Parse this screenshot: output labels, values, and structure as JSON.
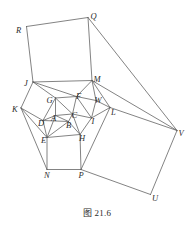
{
  "figure": {
    "caption": "图 21.6",
    "caption_number": "21.6",
    "stroke_color": "#595959",
    "label_color": "#2b2b2b",
    "background_color": "#ffffff",
    "width": 194,
    "height": 231,
    "vertices": [
      {
        "id": "A",
        "label": "A",
        "x": 55.5,
        "y": 115.5,
        "label_x": 51.0,
        "label_y": 114.0
      },
      {
        "id": "B",
        "label": "B",
        "x": 68.5,
        "y": 121.5,
        "label_x": 66.0,
        "label_y": 120.5
      },
      {
        "id": "C",
        "label": "C",
        "x": 72.5,
        "y": 114.0,
        "label_x": 71.5,
        "label_y": 110.5
      },
      {
        "id": "D",
        "label": "D",
        "x": 43.0,
        "y": 120.5,
        "label_x": 38.0,
        "label_y": 119.0
      },
      {
        "id": "E",
        "label": "E",
        "x": 47.0,
        "y": 137.5,
        "label_x": 41.0,
        "label_y": 136.0
      },
      {
        "id": "F",
        "label": "F",
        "x": 76.5,
        "y": 96.5,
        "label_x": 76.0,
        "label_y": 92.0
      },
      {
        "id": "G",
        "label": "G",
        "x": 55.5,
        "y": 98.0,
        "label_x": 46.5,
        "label_y": 96.0
      },
      {
        "id": "H",
        "label": "H",
        "x": 80.0,
        "y": 134.5,
        "label_x": 79.0,
        "label_y": 134.0
      },
      {
        "id": "I",
        "label": "I",
        "x": 91.5,
        "y": 118.0,
        "label_x": 91.5,
        "label_y": 116.5
      },
      {
        "id": "J",
        "label": "J",
        "x": 33.0,
        "y": 82.0,
        "label_x": 24.0,
        "label_y": 79.0
      },
      {
        "id": "K",
        "label": "K",
        "x": 21.0,
        "y": 108.0,
        "label_x": 12.0,
        "label_y": 104.5
      },
      {
        "id": "L",
        "label": "L",
        "x": 110.0,
        "y": 107.5,
        "label_x": 111.0,
        "label_y": 107.5
      },
      {
        "id": "M",
        "label": "M",
        "x": 92.0,
        "y": 80.5,
        "label_x": 93.5,
        "label_y": 75.0
      },
      {
        "id": "N",
        "label": "N",
        "x": 47.0,
        "y": 169.5,
        "label_x": 44.0,
        "label_y": 171.0
      },
      {
        "id": "P",
        "label": "P",
        "x": 81.0,
        "y": 169.5,
        "label_x": 78.5,
        "label_y": 171.0
      },
      {
        "id": "Q",
        "label": "Q",
        "x": 88.0,
        "y": 17.5,
        "label_x": 90.5,
        "label_y": 11.5
      },
      {
        "id": "R",
        "label": "R",
        "x": 26.5,
        "y": 26.5,
        "label_x": 16.0,
        "label_y": 26.0
      },
      {
        "id": "U",
        "label": "U",
        "x": 150.5,
        "y": 194.5,
        "label_x": 152.0,
        "label_y": 194.0
      },
      {
        "id": "V",
        "label": "V",
        "x": 177.0,
        "y": 130.5,
        "label_x": 178.5,
        "label_y": 128.5
      },
      {
        "id": "W",
        "label": "W",
        "x": 96.0,
        "y": 100.5,
        "label_x": 94.5,
        "label_y": 95.5
      }
    ],
    "edges": [
      {
        "from": "R",
        "to": "Q",
        "style": "plain"
      },
      {
        "from": "R",
        "to": "J",
        "style": "plain"
      },
      {
        "from": "Q",
        "to": "M",
        "style": "plain"
      },
      {
        "from": "J",
        "to": "M",
        "style": "plain"
      },
      {
        "from": "Q",
        "to": "V",
        "style": "plain"
      },
      {
        "from": "M",
        "to": "V",
        "style": "plain"
      },
      {
        "from": "M",
        "to": "L",
        "style": "plain"
      },
      {
        "from": "L",
        "to": "V",
        "style": "plain"
      },
      {
        "from": "V",
        "to": "U",
        "style": "plain"
      },
      {
        "from": "L",
        "to": "P",
        "style": "plain"
      },
      {
        "from": "P",
        "to": "U",
        "style": "plain"
      },
      {
        "from": "J",
        "to": "K",
        "style": "plain"
      },
      {
        "from": "K",
        "to": "N",
        "style": "plain"
      },
      {
        "from": "J",
        "to": "G",
        "style": "plain"
      },
      {
        "from": "K",
        "to": "D",
        "style": "plain"
      },
      {
        "from": "J",
        "to": "F",
        "style": "plain"
      },
      {
        "from": "M",
        "to": "F",
        "style": "plain"
      },
      {
        "from": "M",
        "to": "W",
        "style": "plain"
      },
      {
        "from": "W",
        "to": "L",
        "style": "plain"
      },
      {
        "from": "W",
        "to": "I",
        "style": "plain"
      },
      {
        "from": "L",
        "to": "I",
        "style": "plain"
      },
      {
        "from": "F",
        "to": "W",
        "style": "plain"
      },
      {
        "from": "G",
        "to": "F",
        "style": "plain"
      },
      {
        "from": "G",
        "to": "A",
        "style": "plain"
      },
      {
        "from": "F",
        "to": "C",
        "style": "plain"
      },
      {
        "from": "A",
        "to": "C",
        "style": "plain"
      },
      {
        "from": "G",
        "to": "D",
        "style": "plain"
      },
      {
        "from": "D",
        "to": "A",
        "style": "plain"
      },
      {
        "from": "D",
        "to": "E",
        "style": "plain"
      },
      {
        "from": "A",
        "to": "B",
        "style": "plain"
      },
      {
        "from": "B",
        "to": "C",
        "style": "plain"
      },
      {
        "from": "B",
        "to": "H",
        "style": "plain"
      },
      {
        "from": "C",
        "to": "I",
        "style": "plain"
      },
      {
        "from": "E",
        "to": "B",
        "style": "plain"
      },
      {
        "from": "E",
        "to": "H",
        "style": "plain"
      },
      {
        "from": "H",
        "to": "I",
        "style": "plain"
      },
      {
        "from": "E",
        "to": "N",
        "style": "plain"
      },
      {
        "from": "H",
        "to": "P",
        "style": "plain"
      },
      {
        "from": "N",
        "to": "P",
        "style": "plain"
      },
      {
        "from": "K",
        "to": "E",
        "style": "plain"
      },
      {
        "from": "A",
        "to": "E",
        "style": "plain"
      },
      {
        "from": "C",
        "to": "H",
        "style": "plain"
      },
      {
        "from": "G",
        "to": "C",
        "style": "plain"
      },
      {
        "from": "F",
        "to": "I",
        "style": "plain"
      },
      {
        "from": "D",
        "to": "B",
        "style": "plain"
      }
    ]
  }
}
